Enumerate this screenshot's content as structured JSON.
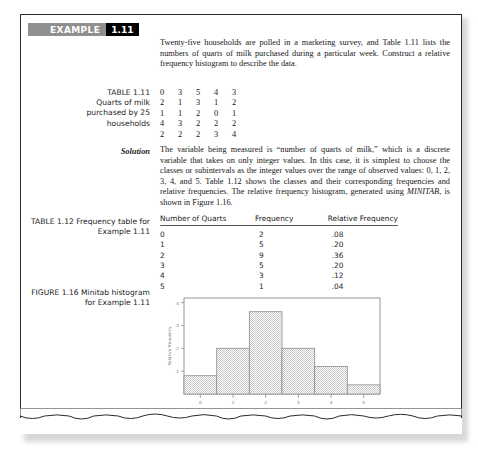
{
  "example": {
    "word": "EXAMPLE",
    "number": "1.11",
    "badge_gray": "#8f8f8f",
    "badge_black": "#000000"
  },
  "intro_paragraph": "Twenty-five households are polled in a marketing survey, and Table 1.11 lists the numbers of quarts of milk purchased during a particular week. Construct a relative frequency histogram to describe the data.",
  "table_1_11": {
    "caption_lines": [
      "TABLE 1.11",
      "Quarts of milk",
      "purchased by 25",
      "households"
    ],
    "rows": [
      [
        "0",
        "3",
        "5",
        "4",
        "3"
      ],
      [
        "2",
        "1",
        "3",
        "1",
        "2"
      ],
      [
        "1",
        "1",
        "2",
        "0",
        "1"
      ],
      [
        "4",
        "3",
        "2",
        "2",
        "2"
      ],
      [
        "2",
        "2",
        "2",
        "3",
        "4"
      ]
    ]
  },
  "solution": {
    "label": "Solution",
    "paragraph_part1": "The variable being measured is “number of quarts of milk,” which is a discrete variable that takes on only integer values. In this case, it is simplest to choose the classes or subintervals as the integer values over the range of observed values: 0, 1, 2, 3, 4, and 5. Table 1.12 shows the classes and their corresponding frequencies and relative frequencies. The relative frequency histogram, generated using ",
    "minitab": "MINITAB",
    "paragraph_part2": ", is shown in Figure 1.16."
  },
  "table_1_12": {
    "caption_lines": [
      "TABLE 1.12",
      "Frequency table for",
      "Example 1.11"
    ],
    "headers": [
      "Number of Quarts",
      "Frequency",
      "Relative Frequency"
    ],
    "rows": [
      [
        "0",
        "2",
        ".08"
      ],
      [
        "1",
        "5",
        ".20"
      ],
      [
        "2",
        "9",
        ".36"
      ],
      [
        "3",
        "5",
        ".20"
      ],
      [
        "4",
        "3",
        ".12"
      ],
      [
        "5",
        "1",
        ".04"
      ]
    ]
  },
  "figure_1_16": {
    "caption_lines": [
      "FIGURE 1.16",
      "Minitab histogram",
      "for Example 1.11"
    ]
  },
  "chart_data": {
    "type": "bar",
    "title": "",
    "xlabel": "Quarts",
    "ylabel": "Relative frequency",
    "categories": [
      "0",
      "1",
      "2",
      "3",
      "4",
      "5"
    ],
    "values": [
      0.08,
      0.2,
      0.36,
      0.2,
      0.12,
      0.04
    ],
    "ylim": [
      0,
      0.42
    ],
    "yticks": [
      ".1",
      ".2",
      ".3",
      ".4"
    ],
    "ytick_values": [
      0.1,
      0.2,
      0.3,
      0.4
    ],
    "xticks": [
      "0",
      "1",
      "2",
      "3",
      "4",
      "5"
    ],
    "grid": false,
    "legend": "none",
    "bar_fill": "#d8d8d8",
    "bar_edge": "#8d8d8d"
  }
}
